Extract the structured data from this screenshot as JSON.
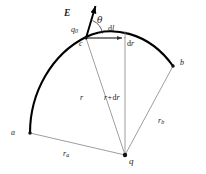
{
  "figure": {
    "type": "physics-diagram",
    "colors": {
      "arc": "#000000",
      "radial_lines": "#8a8a8a",
      "vector": "#000000",
      "text": "#1a1a1a",
      "background": "#ffffff"
    },
    "labels": {
      "field_vector": "E",
      "angle": "θ",
      "test_charge": "q",
      "test_charge_sub": "0",
      "point_c": "c",
      "point_a": "a",
      "point_b": "b",
      "source_charge": "q",
      "arc_element": "d",
      "arc_element_italic": "l",
      "radial_element": "d",
      "radial_element_italic": "r",
      "radius_inner": "r",
      "radius_outer_prefix": "r+",
      "radius_outer_d": "d",
      "radius_outer_r": "r",
      "radius_a": "r",
      "radius_a_sub": "a",
      "radius_b": "r",
      "radius_b_sub": "b"
    },
    "geometry": {
      "apex": {
        "x": 125,
        "y": 155
      },
      "point_a": {
        "x": 30,
        "y": 133
      },
      "point_b": {
        "x": 173,
        "y": 66
      },
      "point_c": {
        "x": 86,
        "y": 37
      },
      "point_dl": {
        "x": 125,
        "y": 37
      },
      "vector_tip": {
        "x": 96,
        "y": 4
      }
    }
  }
}
